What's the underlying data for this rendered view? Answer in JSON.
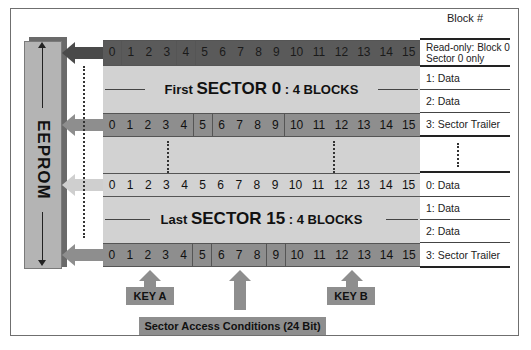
{
  "header": {
    "block_label": "Block #"
  },
  "eeprom": {
    "label": "EEPROM"
  },
  "byte_indices": [
    "0",
    "1",
    "2",
    "3",
    "4",
    "5",
    "6",
    "7",
    "8",
    "9",
    "10",
    "11",
    "12",
    "13",
    "14",
    "15"
  ],
  "first_sector": {
    "prefix": "First",
    "name": "SECTOR 0",
    "suffix": ": 4 BLOCKS",
    "blocks": [
      {
        "label": "Read-only: Block 0 Sector 0 only"
      },
      {
        "label": "1: Data"
      },
      {
        "label": "2: Data"
      },
      {
        "label": "3: Sector Trailer"
      }
    ]
  },
  "last_sector": {
    "prefix": "Last",
    "name": "SECTOR 15",
    "suffix": ": 4 BLOCKS",
    "blocks": [
      {
        "label": "0: Data"
      },
      {
        "label": "1: Data"
      },
      {
        "label": "2: Data"
      },
      {
        "label": "3: Sector Trailer"
      }
    ]
  },
  "trailer_fields": {
    "key_a": "KEY A",
    "access_conditions": "Sector Access Conditions (24 Bit)",
    "key_b": "KEY B"
  },
  "colors": {
    "dark_row": "#5a5a5a",
    "trailer_row": "#8e8e8e",
    "data_area": "#d2d2d2",
    "eeprom_bar": "#b4b4b4"
  }
}
